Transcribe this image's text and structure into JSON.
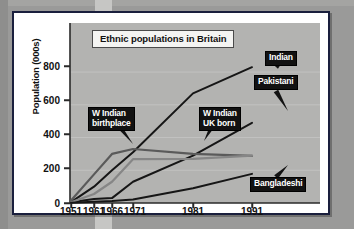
{
  "chart_data": {
    "type": "line",
    "title": "Ethnic populations in Britain",
    "xlabel": "",
    "ylabel": "Population (000s)",
    "x": [
      1951,
      1961,
      1966,
      1971,
      1981,
      1991
    ],
    "xticklabels": [
      "1951",
      "1961",
      "1966",
      "1971",
      "1981",
      "1991"
    ],
    "yticklabels": [
      "0",
      "200",
      "400",
      "600",
      "800"
    ],
    "yticks": [
      0,
      200,
      400,
      600,
      800
    ],
    "ylim": [
      0,
      880
    ],
    "xlim": [
      1949,
      1994
    ],
    "grid": true,
    "legend": "inline-callouts",
    "series": [
      {
        "name": "Indian",
        "color": "#161616",
        "values": [
          5,
          100,
          200,
          310,
          670,
          830
        ]
      },
      {
        "name": "Pakistani",
        "color": "#161616",
        "values": [
          5,
          25,
          30,
          130,
          290,
          490
        ]
      },
      {
        "name": "W Indian birthplace",
        "color": "#5a5a5a",
        "values": [
          15,
          175,
          300,
          330,
          300,
          288
        ]
      },
      {
        "name": "W Indian UK born",
        "color": "#868686",
        "values": [
          5,
          55,
          130,
          268,
          270,
          290
        ]
      },
      {
        "name": "Bangladeshi",
        "color": "#161616",
        "values": [
          2,
          8,
          12,
          22,
          90,
          178
        ]
      }
    ],
    "annotations": [
      {
        "label": "W Indian\nbirthplace",
        "series": "W Indian birthplace"
      },
      {
        "label": "W Indian\nUK born",
        "series": "W Indian UK born"
      },
      {
        "label": "Indian",
        "series": "Indian"
      },
      {
        "label": "Pakistani",
        "series": "Pakistani"
      },
      {
        "label": "Bangladeshi",
        "series": "Bangladeshi"
      }
    ]
  },
  "colors": {
    "page_background": "#9a9a99",
    "card_background": "#ffffff",
    "card_border": "#1a1f3d",
    "plot_background": "#b3b3b1",
    "callout_background": "#121212",
    "callout_text": "#ffffff",
    "title_background": "#f4f4f2",
    "axis": "#2a2a2a"
  }
}
